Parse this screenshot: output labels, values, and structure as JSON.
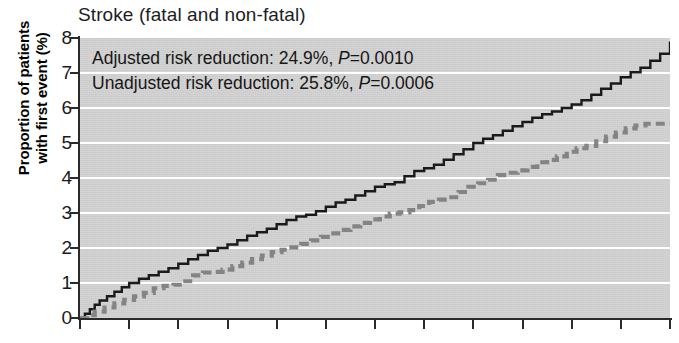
{
  "chart_data": {
    "type": "line",
    "title": "Stroke (fatal and non-fatal)",
    "subtitle": "",
    "xlabel": "",
    "ylabel": "Proportion of patients with first event (%)",
    "ylabel_line1": "Proportion of patients",
    "ylabel_line2": "with first event (%)",
    "ylim": [
      0,
      8
    ],
    "xlim": [
      0,
      12
    ],
    "y_ticks": [
      0,
      1,
      2,
      3,
      4,
      5,
      6,
      7,
      8
    ],
    "y_tick_labels": [
      "0",
      "1",
      "2",
      "3",
      "4",
      "5",
      "6",
      "7",
      "8"
    ],
    "x_ticks": [
      0,
      1,
      2,
      3,
      4,
      5,
      6,
      7,
      8,
      9,
      10,
      11,
      12
    ],
    "x_tick_labels": [
      "",
      "",
      "",
      "",
      "",
      "",
      "",
      "",
      "",
      "",
      "",
      "",
      ""
    ],
    "grid": "horizontal",
    "legend_position": "none",
    "plot_background": "#d2d2d2",
    "gridline_color": "#ffffff",
    "annotations": [
      {
        "id": "adjusted",
        "text": "Adjusted risk reduction: 24.9%, P=0.0010",
        "prefix": "Adjusted risk reduction: 24.9%, ",
        "statistic": "P",
        "suffix": "=0.0010",
        "risk_reduction": "24.9%",
        "p_value": "0.0010"
      },
      {
        "id": "unadjusted",
        "text": "Unadjusted risk reduction: 25.8%, P=0.0006",
        "prefix": "Unadjusted risk reduction: 25.8%, ",
        "statistic": "P",
        "suffix": "=0.0006",
        "risk_reduction": "25.8%",
        "p_value": "0.0006"
      }
    ],
    "series": [
      {
        "name": "Control group (solid black)",
        "color": "#1a1a1a",
        "style": "solid",
        "final_value": 7.9,
        "step": true,
        "x": [
          0.0,
          0.1,
          0.2,
          0.3,
          0.4,
          0.55,
          0.7,
          0.85,
          1.0,
          1.2,
          1.4,
          1.6,
          1.8,
          2.0,
          2.2,
          2.4,
          2.6,
          2.8,
          3.0,
          3.2,
          3.4,
          3.6,
          3.8,
          4.0,
          4.2,
          4.4,
          4.6,
          4.8,
          5.0,
          5.2,
          5.4,
          5.6,
          5.8,
          6.0,
          6.2,
          6.4,
          6.6,
          6.8,
          7.0,
          7.2,
          7.4,
          7.6,
          7.8,
          8.0,
          8.2,
          8.4,
          8.6,
          8.8,
          9.0,
          9.2,
          9.4,
          9.6,
          9.8,
          10.0,
          10.2,
          10.4,
          10.6,
          10.8,
          11.0,
          11.2,
          11.4,
          11.6,
          11.8,
          12.0
        ],
        "y": [
          0.0,
          0.12,
          0.25,
          0.38,
          0.5,
          0.62,
          0.75,
          0.88,
          1.0,
          1.12,
          1.22,
          1.32,
          1.42,
          1.55,
          1.68,
          1.8,
          1.92,
          2.0,
          2.1,
          2.22,
          2.35,
          2.45,
          2.55,
          2.68,
          2.8,
          2.9,
          2.95,
          3.05,
          3.18,
          3.3,
          3.38,
          3.5,
          3.62,
          3.75,
          3.82,
          3.88,
          4.05,
          4.2,
          4.28,
          4.38,
          4.52,
          4.68,
          4.82,
          5.0,
          5.12,
          5.22,
          5.35,
          5.48,
          5.6,
          5.72,
          5.82,
          5.9,
          6.0,
          6.1,
          6.22,
          6.38,
          6.55,
          6.7,
          6.88,
          7.02,
          7.15,
          7.35,
          7.55,
          7.9
        ]
      },
      {
        "name": "Treatment group (dashed grey)",
        "color": "#848484",
        "style": "dashed",
        "final_value": 5.55,
        "step": true,
        "x": [
          0.0,
          0.15,
          0.3,
          0.5,
          0.7,
          0.9,
          1.1,
          1.3,
          1.5,
          1.7,
          1.9,
          2.1,
          2.3,
          2.5,
          2.7,
          2.9,
          3.1,
          3.3,
          3.5,
          3.7,
          3.9,
          4.1,
          4.3,
          4.5,
          4.7,
          4.9,
          5.1,
          5.3,
          5.5,
          5.7,
          5.9,
          6.1,
          6.3,
          6.5,
          6.7,
          6.9,
          7.1,
          7.3,
          7.5,
          7.7,
          7.9,
          8.1,
          8.3,
          8.5,
          8.7,
          8.9,
          9.1,
          9.3,
          9.5,
          9.7,
          9.9,
          10.1,
          10.3,
          10.5,
          10.7,
          10.9,
          11.1,
          11.3,
          11.5,
          11.7,
          12.0
        ],
        "y": [
          0.0,
          0.08,
          0.18,
          0.3,
          0.42,
          0.52,
          0.62,
          0.72,
          0.85,
          0.92,
          0.95,
          1.05,
          1.22,
          1.3,
          1.32,
          1.38,
          1.48,
          1.58,
          1.68,
          1.78,
          1.88,
          1.95,
          2.02,
          2.12,
          2.22,
          2.32,
          2.42,
          2.52,
          2.62,
          2.72,
          2.82,
          2.9,
          2.98,
          3.02,
          3.08,
          3.2,
          3.32,
          3.38,
          3.45,
          3.6,
          3.75,
          3.85,
          3.95,
          4.08,
          4.15,
          4.22,
          4.32,
          4.45,
          4.52,
          4.62,
          4.75,
          4.85,
          4.92,
          5.05,
          5.18,
          5.3,
          5.42,
          5.5,
          5.55,
          5.55,
          5.55
        ]
      }
    ]
  }
}
